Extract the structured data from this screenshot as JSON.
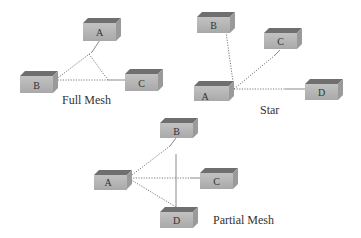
{
  "colors": {
    "box_front": "#b9b9b9",
    "box_top": "#6f6f6f",
    "box_side": "#9a9a9a",
    "line": "#7a7a7a",
    "text": "#333333",
    "background": "#ffffff"
  },
  "diagrams": [
    {
      "id": "full-mesh",
      "caption": "Full Mesh",
      "nodes": [
        {
          "id": "A",
          "label": "A"
        },
        {
          "id": "B",
          "label": "B"
        },
        {
          "id": "C",
          "label": "C"
        }
      ],
      "links": [
        [
          "A",
          "B"
        ],
        [
          "A",
          "C"
        ],
        [
          "B",
          "C"
        ]
      ]
    },
    {
      "id": "star",
      "caption": "Star",
      "nodes": [
        {
          "id": "A",
          "label": "A"
        },
        {
          "id": "B",
          "label": "B"
        },
        {
          "id": "C",
          "label": "C"
        },
        {
          "id": "D",
          "label": "D"
        }
      ],
      "links": [
        [
          "A",
          "B"
        ],
        [
          "A",
          "C"
        ],
        [
          "A",
          "D"
        ]
      ]
    },
    {
      "id": "partial-mesh",
      "caption": "Partial Mesh",
      "nodes": [
        {
          "id": "A",
          "label": "A"
        },
        {
          "id": "B",
          "label": "B"
        },
        {
          "id": "C",
          "label": "C"
        },
        {
          "id": "D",
          "label": "D"
        }
      ],
      "links": [
        [
          "A",
          "B"
        ],
        [
          "A",
          "C"
        ],
        [
          "A",
          "D"
        ],
        [
          "B",
          "D"
        ]
      ]
    }
  ]
}
